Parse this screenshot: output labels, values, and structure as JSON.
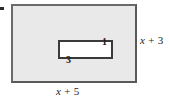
{
  "figure": {
    "name": "nested-rectangles-area-diagram",
    "outer_rectangle": {
      "name": "outer-rectangle",
      "fill_color": "#e9e9e9",
      "stroke_color": "#6a6a6a",
      "width_label": "x + 5",
      "width_label_var": "x",
      "width_label_rest": " + 5",
      "height_label": "x + 3",
      "height_label_var": "x",
      "height_label_rest": " + 3"
    },
    "inner_rectangle": {
      "name": "inner-rectangle",
      "fill_color": "#ffffff",
      "stroke_color": "#3a3a3a",
      "width_label": "3",
      "height_label": "1"
    },
    "corner_mark": {
      "name": "corner-mark",
      "color": "#2b2b2b"
    }
  }
}
